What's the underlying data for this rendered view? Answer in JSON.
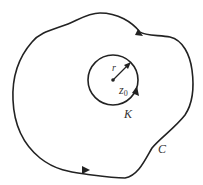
{
  "diagram": {
    "labels": {
      "radius": "r",
      "center": "z",
      "center_sub": "0",
      "inner_circle": "K",
      "outer_contour": "C"
    },
    "colors": {
      "stroke": "#222222",
      "background": "#ffffff"
    }
  }
}
